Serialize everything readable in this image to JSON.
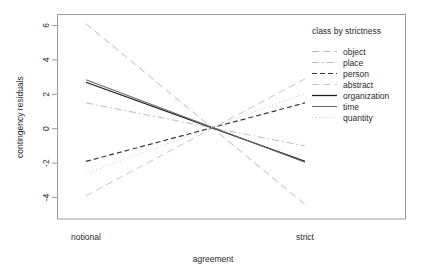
{
  "chart_data": {
    "type": "line",
    "title": "",
    "xlabel": "agreement",
    "ylabel": "contingency residuals",
    "categories": [
      "notional",
      "strict"
    ],
    "x_tick_labels": [
      "notional",
      "strict"
    ],
    "y_tick_labels": [
      "6",
      "4",
      "2",
      "0",
      "-2",
      "-4"
    ],
    "y_ticks": [
      6,
      4,
      2,
      0,
      -2,
      -4
    ],
    "ylim": [
      -5.3,
      6.8
    ],
    "grid": false,
    "legend_position": "top-right-inside",
    "legend_title": "class by strictness",
    "series": [
      {
        "name": "object",
        "values": [
          6.1,
          -4.4
        ],
        "linestyle": "longdash",
        "color": "#b8b8b8",
        "width": 1.0
      },
      {
        "name": "place",
        "values": [
          1.5,
          -1.0
        ],
        "linestyle": "dashdot",
        "color": "#bcbcbc",
        "width": 1.0
      },
      {
        "name": "person",
        "values": [
          -1.9,
          1.5
        ],
        "linestyle": "dashed",
        "color": "#3a3a3a",
        "width": 1.2
      },
      {
        "name": "abstract",
        "values": [
          -3.9,
          2.9
        ],
        "linestyle": "longdash",
        "color": "#c4c4c4",
        "width": 1.0
      },
      {
        "name": "organization",
        "values": [
          2.7,
          -1.9
        ],
        "linestyle": "solid",
        "color": "#1c1c1c",
        "width": 1.3
      },
      {
        "name": "time",
        "values": [
          2.85,
          -1.95
        ],
        "linestyle": "solid",
        "color": "#6e6e6e",
        "width": 1.1
      },
      {
        "name": "quantity",
        "values": [
          -2.6,
          2.05
        ],
        "linestyle": "dotted",
        "color": "#c8c8c8",
        "width": 1.0
      }
    ]
  },
  "legend": {
    "title": "class by strictness",
    "entries": [
      {
        "label": "object"
      },
      {
        "label": "place"
      },
      {
        "label": "person"
      },
      {
        "label": "abstract"
      },
      {
        "label": "organization"
      },
      {
        "label": "time"
      },
      {
        "label": "quantity"
      }
    ]
  },
  "axes": {
    "y_label": "contingency residuals",
    "x_label": "agreement",
    "y_ticks": [
      "6",
      "4",
      "2",
      "0",
      "-2",
      "-4"
    ],
    "x_ticks": [
      "notional",
      "strict"
    ]
  },
  "colors": {
    "frame": "#9a9a9a",
    "text": "#2b2b2b",
    "background": "#ffffff"
  }
}
